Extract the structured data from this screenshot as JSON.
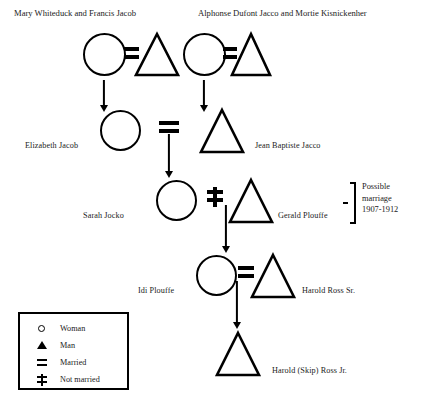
{
  "diagram": {
    "title_hidden": "Family genealogy chart",
    "headers": [
      {
        "text": "Mary Whiteduck and Francis Jacob"
      },
      {
        "text": "Alphonse Dufont Jacco and Mortie Kisnickenher"
      }
    ],
    "generations": [
      {
        "id": "gen1",
        "couples": [
          {
            "woman": "",
            "man": "",
            "relation": "=",
            "relation_name": "married"
          },
          {
            "woman": "",
            "man": "",
            "relation": "=",
            "relation_name": "married"
          }
        ]
      },
      {
        "id": "gen2",
        "woman_label": "Elizabeth Jacob",
        "man_label": "Jean Baptiste Jacco",
        "relation": "=",
        "relation_name": "married"
      },
      {
        "id": "gen3",
        "woman_label": "Sarah Jocko",
        "man_label": "Gerald Plouffe",
        "relation": "≠",
        "relation_name": "not-married"
      },
      {
        "id": "gen4",
        "woman_label": "Idi Plouffe",
        "man_label": "Harold Ross Sr.",
        "relation": "=",
        "relation_name": "married"
      },
      {
        "id": "gen5",
        "man_label": "Harold (Skip) Ross Jr."
      }
    ],
    "annotation": {
      "line1": "Possible",
      "line2": "marriage",
      "line3": "1907-1912"
    },
    "legend": {
      "items": [
        {
          "symbol": "circle",
          "label": "Woman"
        },
        {
          "symbol": "triangle",
          "label": "Man"
        },
        {
          "symbol": "equals",
          "label": "Married"
        },
        {
          "symbol": "not-equals",
          "label": "Not married"
        }
      ]
    },
    "colors": {
      "ink": "#000000",
      "text": "#222222",
      "background": "#ffffff"
    }
  }
}
